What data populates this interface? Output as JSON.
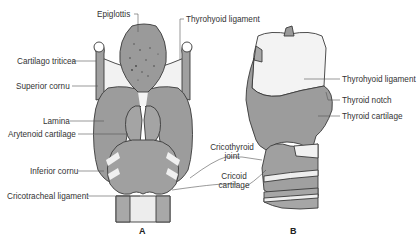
{
  "figure": {
    "panels": [
      {
        "id": "A",
        "label": "A",
        "view": "anterior"
      },
      {
        "id": "B",
        "label": "B",
        "view": "lateral"
      }
    ],
    "colors": {
      "cartilage": "#9c9c9c",
      "cartilage_dark": "#8a8a8a",
      "ligament": "#eeeeee",
      "outline": "#3a3a3a",
      "leader": "#555555",
      "text": "#333333"
    }
  },
  "labels_a": {
    "epiglottis": "Epiglottis",
    "thyrohyoid_ligament": "Thyrohyoid ligament",
    "cartilago_triticea": "Cartilago triticea",
    "superior_cornu": "Superior cornu",
    "lamina": "Lamina",
    "arytenoid_cartilage": "Arytenoid cartilage",
    "inferior_cornu": "Inferior cornu",
    "cricotracheal_ligament": "Cricotracheal ligament"
  },
  "labels_shared": {
    "cricothyroid_joint_line1": "Cricothyroid",
    "cricothyroid_joint_line2": "joint",
    "cricoid_cartilage_line1": "Cricoid",
    "cricoid_cartilage_line2": "cartilage"
  },
  "labels_b": {
    "thyrohyoid_ligament": "Thyrohyoid ligament",
    "thyroid_notch": "Thyroid notch",
    "thyroid_cartilage": "Thyroid cartilage"
  }
}
